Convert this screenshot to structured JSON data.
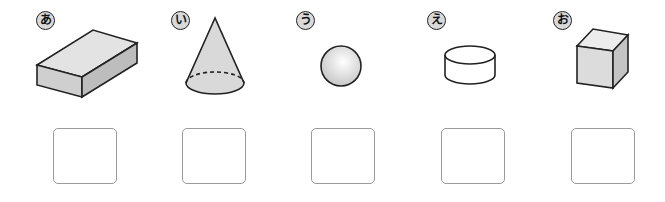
{
  "items": [
    {
      "label": "あ",
      "shape": "rectangular-prism",
      "answer": ""
    },
    {
      "label": "い",
      "shape": "cone",
      "answer": ""
    },
    {
      "label": "う",
      "shape": "sphere",
      "answer": ""
    },
    {
      "label": "え",
      "shape": "cylinder",
      "answer": ""
    },
    {
      "label": "お",
      "shape": "cube",
      "answer": ""
    }
  ],
  "colors": {
    "shape_fill": "#d6d6d6",
    "outline": "#222222",
    "box_border": "#9a9a9a",
    "label_fill": "#d9d9d9"
  }
}
